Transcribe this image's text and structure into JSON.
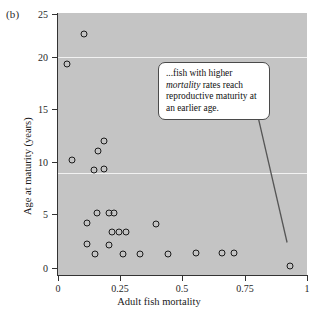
{
  "figure": {
    "panel_label": "(b)"
  },
  "annotation": {
    "line1_pre": "...fish with higher ",
    "emphasis": "mortality",
    "line1_post": " rates reach reproductive maturity at an earlier age.",
    "full_text": "...fish with higher mortality rates reach reproductive maturity at an earlier age."
  },
  "chart_data": {
    "type": "scatter",
    "title": "",
    "xlabel": "Adult fish mortality",
    "ylabel": "Age at maturity (years)",
    "xlim": [
      0,
      1
    ],
    "ylim": [
      0,
      25
    ],
    "xticks": [
      "0",
      "0.25",
      "0.5",
      "0.75",
      "1"
    ],
    "xtick_values": [
      0,
      0.25,
      0.5,
      0.75,
      1
    ],
    "yticks": [
      "0",
      "5",
      "10",
      "15",
      "20",
      "25"
    ],
    "ytick_values": [
      0,
      5,
      10,
      15,
      20,
      25
    ],
    "grid": "horizontal gridlines at y = 20, 10 (white)",
    "plot_background": "#c4c4c4",
    "marker": "open-circle",
    "marker_color": "#1b1b1b",
    "legend": "none",
    "points": [
      {
        "x": 0.105,
        "y": 23.0
      },
      {
        "x": 0.035,
        "y": 20.1
      },
      {
        "x": 0.185,
        "y": 12.8
      },
      {
        "x": 0.16,
        "y": 11.8
      },
      {
        "x": 0.055,
        "y": 11.0
      },
      {
        "x": 0.145,
        "y": 10.0
      },
      {
        "x": 0.185,
        "y": 10.1
      },
      {
        "x": 0.155,
        "y": 5.9
      },
      {
        "x": 0.205,
        "y": 5.9
      },
      {
        "x": 0.225,
        "y": 5.9
      },
      {
        "x": 0.115,
        "y": 5.0
      },
      {
        "x": 0.395,
        "y": 4.9
      },
      {
        "x": 0.215,
        "y": 4.1
      },
      {
        "x": 0.245,
        "y": 4.1
      },
      {
        "x": 0.275,
        "y": 4.1
      },
      {
        "x": 0.115,
        "y": 3.0
      },
      {
        "x": 0.205,
        "y": 2.9
      },
      {
        "x": 0.15,
        "y": 2.0
      },
      {
        "x": 0.26,
        "y": 2.0
      },
      {
        "x": 0.33,
        "y": 2.0
      },
      {
        "x": 0.44,
        "y": 2.0
      },
      {
        "x": 0.555,
        "y": 2.1
      },
      {
        "x": 0.66,
        "y": 2.1
      },
      {
        "x": 0.705,
        "y": 2.1
      },
      {
        "x": 0.93,
        "y": 0.9
      }
    ],
    "annotation_text": "...fish with higher mortality rates reach reproductive maturity at an earlier age.",
    "annotation_leader": {
      "from": [
        0.78,
        17.5
      ],
      "to": [
        0.92,
        3.1
      ]
    }
  }
}
